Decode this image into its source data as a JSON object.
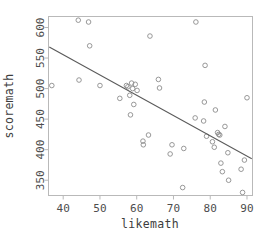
{
  "chart_data": {
    "type": "scatter",
    "title": "",
    "subtitle": "",
    "xlabel": "likemath",
    "ylabel": "scoremath",
    "xlim": [
      36.0,
      91.5
    ],
    "ylim": [
      325,
      618
    ],
    "grid": false,
    "legend": null,
    "xticks": [
      40,
      50,
      60,
      70,
      80,
      90
    ],
    "yticks": [
      350,
      400,
      450,
      500,
      550,
      600
    ],
    "xtick_labels": [
      "40",
      "50",
      "60",
      "70",
      "80",
      "90"
    ],
    "ytick_labels": [
      "350",
      "400",
      "450",
      "500",
      "550",
      "600"
    ],
    "marker": "open-circle",
    "marker_color": "#8c8c8c",
    "frame_color": "#b9b9b9",
    "points": [
      {
        "x": 36.9,
        "y": 505
      },
      {
        "x": 44.1,
        "y": 612
      },
      {
        "x": 44.3,
        "y": 514
      },
      {
        "x": 46.9,
        "y": 609
      },
      {
        "x": 47.2,
        "y": 570
      },
      {
        "x": 50.0,
        "y": 505
      },
      {
        "x": 55.4,
        "y": 484
      },
      {
        "x": 57.2,
        "y": 505
      },
      {
        "x": 57.6,
        "y": 503
      },
      {
        "x": 58.1,
        "y": 489
      },
      {
        "x": 58.3,
        "y": 457
      },
      {
        "x": 58.6,
        "y": 509
      },
      {
        "x": 58.9,
        "y": 500
      },
      {
        "x": 59.2,
        "y": 474
      },
      {
        "x": 59.6,
        "y": 507
      },
      {
        "x": 60.1,
        "y": 497
      },
      {
        "x": 61.7,
        "y": 414
      },
      {
        "x": 61.8,
        "y": 408
      },
      {
        "x": 63.2,
        "y": 424
      },
      {
        "x": 63.6,
        "y": 586
      },
      {
        "x": 65.9,
        "y": 515
      },
      {
        "x": 66.2,
        "y": 501
      },
      {
        "x": 69.1,
        "y": 393
      },
      {
        "x": 69.6,
        "y": 408
      },
      {
        "x": 72.5,
        "y": 338
      },
      {
        "x": 72.8,
        "y": 402
      },
      {
        "x": 75.9,
        "y": 452
      },
      {
        "x": 76.1,
        "y": 609
      },
      {
        "x": 78.2,
        "y": 447
      },
      {
        "x": 78.4,
        "y": 478
      },
      {
        "x": 78.6,
        "y": 538
      },
      {
        "x": 79.0,
        "y": 422
      },
      {
        "x": 80.6,
        "y": 413
      },
      {
        "x": 81.1,
        "y": 404
      },
      {
        "x": 81.4,
        "y": 465
      },
      {
        "x": 82.0,
        "y": 428
      },
      {
        "x": 82.3,
        "y": 425
      },
      {
        "x": 82.6,
        "y": 424
      },
      {
        "x": 82.9,
        "y": 378
      },
      {
        "x": 83.3,
        "y": 364
      },
      {
        "x": 84.0,
        "y": 438
      },
      {
        "x": 84.8,
        "y": 395
      },
      {
        "x": 85.0,
        "y": 350
      },
      {
        "x": 88.4,
        "y": 368
      },
      {
        "x": 88.8,
        "y": 330
      },
      {
        "x": 89.3,
        "y": 383
      },
      {
        "x": 90.0,
        "y": 485
      }
    ],
    "regression_line": {
      "x_start": 36.2,
      "y_start": 568,
      "x_end": 91.3,
      "y_end": 385,
      "color": "#5a5a5a"
    }
  }
}
